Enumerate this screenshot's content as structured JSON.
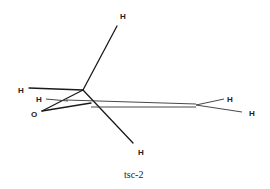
{
  "figure": {
    "caption": "tsc-2",
    "atoms": [
      {
        "id": "H_top",
        "label": "H",
        "x": 120,
        "y": 19
      },
      {
        "id": "H_left",
        "label": "H",
        "x": 18,
        "y": 93
      },
      {
        "id": "H_mid",
        "label": "H",
        "x": 36,
        "y": 102
      },
      {
        "id": "O",
        "label": "O",
        "x": 31,
        "y": 117
      },
      {
        "id": "H_bottom",
        "label": "H",
        "x": 138,
        "y": 155
      },
      {
        "id": "H_right_upper",
        "label": "H",
        "x": 227,
        "y": 102
      },
      {
        "id": "H_right_lower",
        "label": "H",
        "x": 249,
        "y": 116
      }
    ],
    "colors": {
      "line": "#1a1a1a",
      "background": "#ffffff"
    }
  }
}
